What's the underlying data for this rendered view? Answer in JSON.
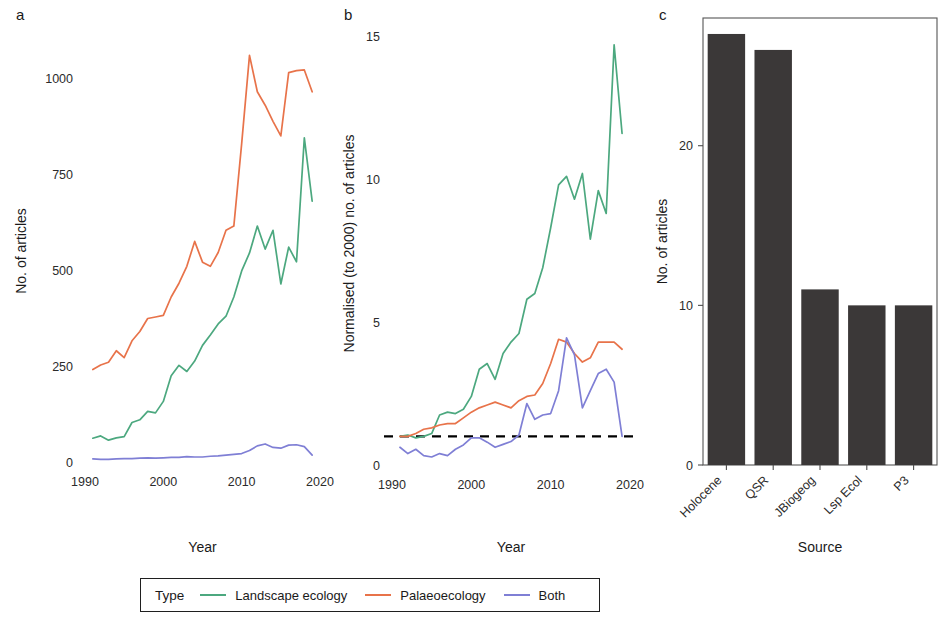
{
  "figure": {
    "panels": [
      {
        "id": "a",
        "label": "a"
      },
      {
        "id": "b",
        "label": "b"
      },
      {
        "id": "c",
        "label": "c"
      }
    ]
  },
  "legend": {
    "title": "Type",
    "items": [
      {
        "label": "Landscape ecology",
        "color": "#4ca87f"
      },
      {
        "label": "Palaeoecology",
        "color": "#e8734a"
      },
      {
        "label": "Both",
        "color": "#7f7fd5"
      }
    ]
  },
  "colors": {
    "landscape_ecology": "#4ca87f",
    "palaeoecology": "#e8734a",
    "both": "#7f7fd5",
    "bar_fill": "#3b3838",
    "reference_line": "#000000",
    "axis": "#4d4d4d",
    "text": "#1a1a1a"
  },
  "chart_data": [
    {
      "id": "a",
      "type": "line",
      "title": "",
      "xlabel": "Year",
      "ylabel": "No. of articles",
      "xlim": [
        1990,
        2020
      ],
      "ylim": [
        0,
        1100
      ],
      "xticks": [
        1990,
        2000,
        2010,
        2020
      ],
      "yticks": [
        0,
        250,
        500,
        750,
        1000
      ],
      "grid": false,
      "legend_position": "bottom",
      "x": [
        1991,
        1992,
        1993,
        1994,
        1995,
        1996,
        1997,
        1998,
        1999,
        2000,
        2001,
        2002,
        2003,
        2004,
        2005,
        2006,
        2007,
        2008,
        2009,
        2010,
        2011,
        2012,
        2013,
        2014,
        2015,
        2016,
        2017,
        2018,
        2019
      ],
      "series": [
        {
          "name": "Landscape ecology",
          "color": "#4ca87f",
          "values": [
            62,
            68,
            57,
            63,
            66,
            103,
            110,
            132,
            128,
            158,
            225,
            252,
            236,
            263,
            304,
            331,
            360,
            380,
            430,
            498,
            545,
            615,
            555,
            604,
            464,
            560,
            522,
            845,
            680
          ]
        },
        {
          "name": "Palaeoecology",
          "color": "#e8734a",
          "values": [
            241,
            253,
            260,
            290,
            272,
            316,
            340,
            374,
            378,
            382,
            430,
            466,
            510,
            575,
            521,
            510,
            546,
            604,
            615,
            830,
            1060,
            965,
            930,
            888,
            850,
            1015,
            1020,
            1022,
            965
          ]
        },
        {
          "name": "Both",
          "color": "#7f7fd5",
          "values": [
            8,
            7,
            7,
            8,
            9,
            9,
            10,
            11,
            10,
            11,
            12,
            12,
            14,
            13,
            13,
            15,
            16,
            18,
            20,
            22,
            30,
            42,
            47,
            38,
            36,
            44,
            45,
            40,
            18
          ]
        }
      ]
    },
    {
      "id": "b",
      "type": "line",
      "title": "",
      "xlabel": "Year",
      "ylabel": "Normalised (to 2000) no. of articles",
      "xlim": [
        1990,
        2020
      ],
      "ylim": [
        0,
        15.5
      ],
      "xticks": [
        1990,
        2000,
        2010,
        2020
      ],
      "yticks": [
        0,
        5,
        10,
        15
      ],
      "grid": false,
      "legend_position": "bottom",
      "reference_line": {
        "y": 1,
        "style": "dashed",
        "color": "#000000"
      },
      "x": [
        1991,
        1992,
        1993,
        1994,
        1995,
        1996,
        1997,
        1998,
        1999,
        2000,
        2001,
        2002,
        2003,
        2004,
        2005,
        2006,
        2007,
        2008,
        2009,
        2010,
        2011,
        2012,
        2013,
        2014,
        2015,
        2016,
        2017,
        2018,
        2019
      ],
      "series": [
        {
          "name": "Landscape ecology",
          "color": "#4ca87f",
          "values": [
            1.0,
            1.05,
            0.95,
            1.0,
            1.1,
            1.75,
            1.85,
            1.8,
            1.95,
            2.4,
            3.35,
            3.55,
            3.0,
            3.9,
            4.3,
            4.6,
            5.8,
            6.0,
            6.9,
            8.3,
            9.8,
            10.1,
            9.3,
            10.2,
            7.9,
            9.6,
            8.8,
            14.7,
            11.6
          ]
        },
        {
          "name": "Palaeoecology",
          "color": "#e8734a",
          "values": [
            1.0,
            1.0,
            1.1,
            1.25,
            1.3,
            1.4,
            1.45,
            1.45,
            1.65,
            1.85,
            2.0,
            2.1,
            2.2,
            2.1,
            2.0,
            2.25,
            2.4,
            2.45,
            2.85,
            3.55,
            4.4,
            4.3,
            3.9,
            3.6,
            3.75,
            4.3,
            4.3,
            4.3,
            4.05
          ]
        },
        {
          "name": "Both",
          "color": "#7f7fd5",
          "values": [
            0.62,
            0.4,
            0.55,
            0.33,
            0.28,
            0.4,
            0.33,
            0.55,
            0.7,
            0.95,
            0.95,
            0.8,
            0.62,
            0.72,
            0.82,
            1.05,
            2.15,
            1.6,
            1.75,
            1.8,
            2.6,
            4.45,
            3.85,
            2.0,
            2.6,
            3.2,
            3.35,
            2.9,
            1.0
          ]
        }
      ]
    },
    {
      "id": "c",
      "type": "bar",
      "title": "",
      "xlabel": "Source",
      "ylabel": "No. of articles",
      "categories": [
        "Holocene",
        "QSR",
        "JBiogeog",
        "Lsp Ecol",
        "P3"
      ],
      "values": [
        27,
        26,
        11,
        10,
        10
      ],
      "ylim": [
        0,
        28
      ],
      "yticks": [
        0,
        10,
        20
      ],
      "grid": false,
      "bar_color": "#3b3838"
    }
  ]
}
